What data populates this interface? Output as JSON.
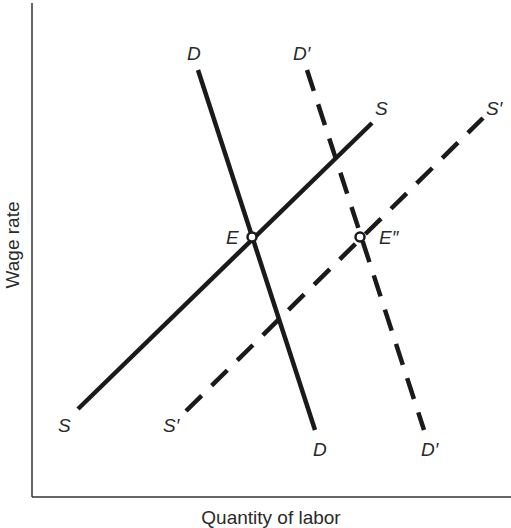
{
  "diagram": {
    "type": "labor-market supply-demand",
    "x_axis_label": "Quantity of labor",
    "y_axis_label": "Wage rate",
    "curves": [
      {
        "id": "D",
        "label_top": "D",
        "label_bottom": "D",
        "style": "solid",
        "from": [
          198,
          70
        ],
        "to": [
          315,
          430
        ]
      },
      {
        "id": "D_prime",
        "label_top": "D′",
        "label_bottom": "D′",
        "style": "dashed",
        "from": [
          307,
          70
        ],
        "to": [
          424,
          430
        ]
      },
      {
        "id": "S",
        "label_top": "S",
        "label_bottom": "S",
        "style": "solid",
        "from": [
          78,
          409
        ],
        "to": [
          372,
          123
        ]
      },
      {
        "id": "S_prime",
        "label_top": "S′",
        "label_bottom": "S′",
        "style": "dashed",
        "from": [
          186,
          411
        ],
        "to": [
          483,
          118
        ]
      }
    ],
    "points": [
      {
        "id": "E",
        "label": "E",
        "at": [
          252,
          237
        ]
      },
      {
        "id": "E_double_prime",
        "label": "E″",
        "at": [
          360,
          237
        ]
      }
    ],
    "colors": {
      "line": "#1a1a1a",
      "text": "#2a2a2a",
      "background": "#ffffff"
    }
  }
}
